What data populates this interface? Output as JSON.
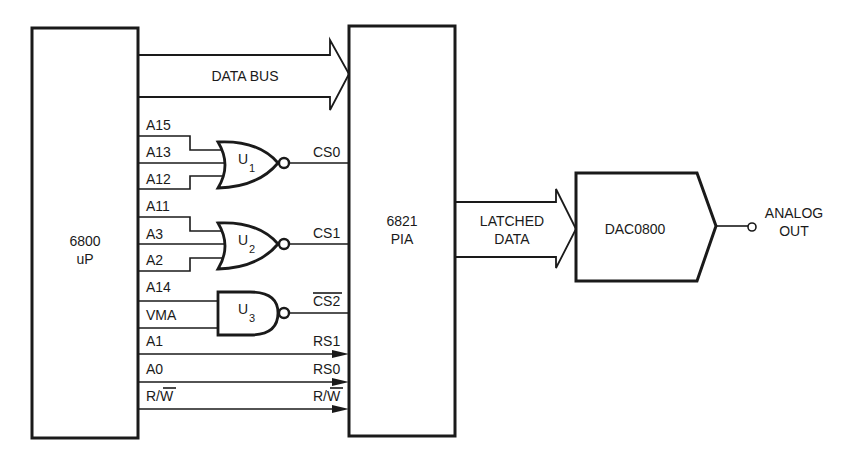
{
  "diagram": {
    "blocks": {
      "cpu": {
        "line1": "6800",
        "line2": "uP"
      },
      "pia": {
        "line1": "6821",
        "line2": "PIA"
      },
      "dac": {
        "label": "DAC0800"
      }
    },
    "buses": {
      "data_bus": {
        "label": "DATA BUS"
      },
      "latched_data": {
        "line1": "LATCHED",
        "line2": "DATA"
      }
    },
    "output": {
      "line1": "ANALOG",
      "line2": "OUT"
    },
    "gates": [
      {
        "id": "U1",
        "type": "NOR",
        "label_main": "U",
        "label_sub": "1",
        "inputs": [
          "A15",
          "A13",
          "A12"
        ],
        "output": "CS0"
      },
      {
        "id": "U2",
        "type": "NOR",
        "label_main": "U",
        "label_sub": "2",
        "inputs": [
          "A11",
          "A3",
          "A2"
        ],
        "output": "CS1"
      },
      {
        "id": "U3",
        "type": "NAND",
        "label_main": "U",
        "label_sub": "3",
        "inputs": [
          "A14",
          "VMA"
        ],
        "output": "CS2",
        "output_overbar": true
      }
    ],
    "signals": {
      "a15": "A15",
      "a13": "A13",
      "a12": "A12",
      "a11": "A11",
      "a3": "A3",
      "a2": "A2",
      "a14": "A14",
      "vma": "VMA",
      "a1": "A1",
      "a0": "A0",
      "rw_src": "R/",
      "rw_src_bar": "W",
      "cs0": "CS0",
      "cs1": "CS1",
      "cs2": "CS2",
      "rs1": "RS1",
      "rs0": "RS0",
      "rw_dst": "R/",
      "rw_dst_bar": "W"
    }
  }
}
